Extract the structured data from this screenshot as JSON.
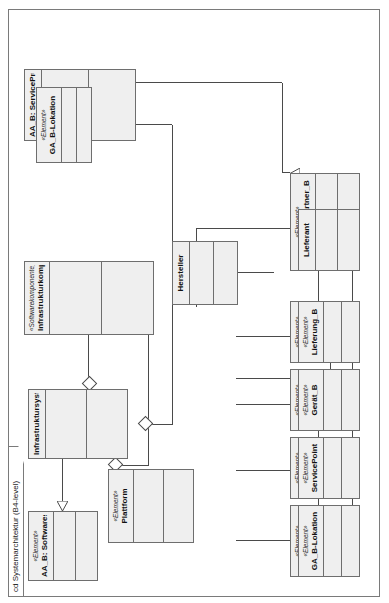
{
  "diagram": {
    "title": "cd Systemarchitektur (B4-level)",
    "kind": "uml-class-diagram",
    "rotation_degrees": -90,
    "background": "#ffffff",
    "box_fill": "#efefef",
    "line_color": "#4a4a4a"
  },
  "classes": [
    {
      "id": "aab_softwaresystem",
      "stereotype": "«Element»",
      "name": "AA_B: Softwaresystem"
    },
    {
      "id": "infrastruktursystem",
      "stereotype": "",
      "name": "Infrastruktursystem"
    },
    {
      "id": "infrastrukturkomponente",
      "stereotype": "«Softwarekomponente_B»",
      "name": "Infrastrukturkomponente"
    },
    {
      "id": "aab_serviceprovider",
      "stereotype": "",
      "name": "AA_B: ServiceProvider"
    },
    {
      "id": "plattform",
      "stereotype": "«Element»",
      "name": "Plattform"
    },
    {
      "id": "hersteller",
      "stereotype": "",
      "name": "Hersteller"
    },
    {
      "id": "servicepointtyp",
      "stereotype": "«Element»",
      "name": "ServicePointTyp"
    },
    {
      "id": "hvservice_b",
      "stereotype": "«Element»",
      "name": "HVService_B"
    },
    {
      "id": "geraetetyp_b",
      "stereotype": "«Element»",
      "name": "Gerätetyp_B"
    },
    {
      "id": "kondition_b",
      "stereotype": "«Element»",
      "name": "Kondition_B"
    },
    {
      "id": "itgeschaeftspartner_b",
      "stereotype": "«Element»",
      "name": "ITGeschäftspartner_B"
    },
    {
      "id": "ga_b_lokation",
      "stereotype": "«Element»",
      "name": "GA_B-Lokation"
    },
    {
      "id": "servicepoint",
      "stereotype": "«Element»",
      "name": "ServicePoint"
    },
    {
      "id": "geraet_b",
      "stereotype": "«Element»",
      "name": "Gerät_B"
    },
    {
      "id": "lieferung_b",
      "stereotype": "«Element»",
      "name": "Lieferung_B"
    },
    {
      "id": "lieferant",
      "stereotype": "",
      "name": "Lieferant"
    }
  ]
}
